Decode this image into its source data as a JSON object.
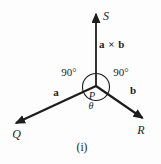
{
  "figure": {
    "caption": "(i)",
    "colors": {
      "ink": "#1d1d1d",
      "background": "#fdfdfd"
    },
    "labels": {
      "s_axis": "S",
      "cross_product": "a × b",
      "left_angle": "90°",
      "right_angle": "90°",
      "origin": "P",
      "theta": "θ",
      "vector_a": "a",
      "vector_b": "b",
      "point_q": "Q",
      "point_r": "R"
    }
  }
}
